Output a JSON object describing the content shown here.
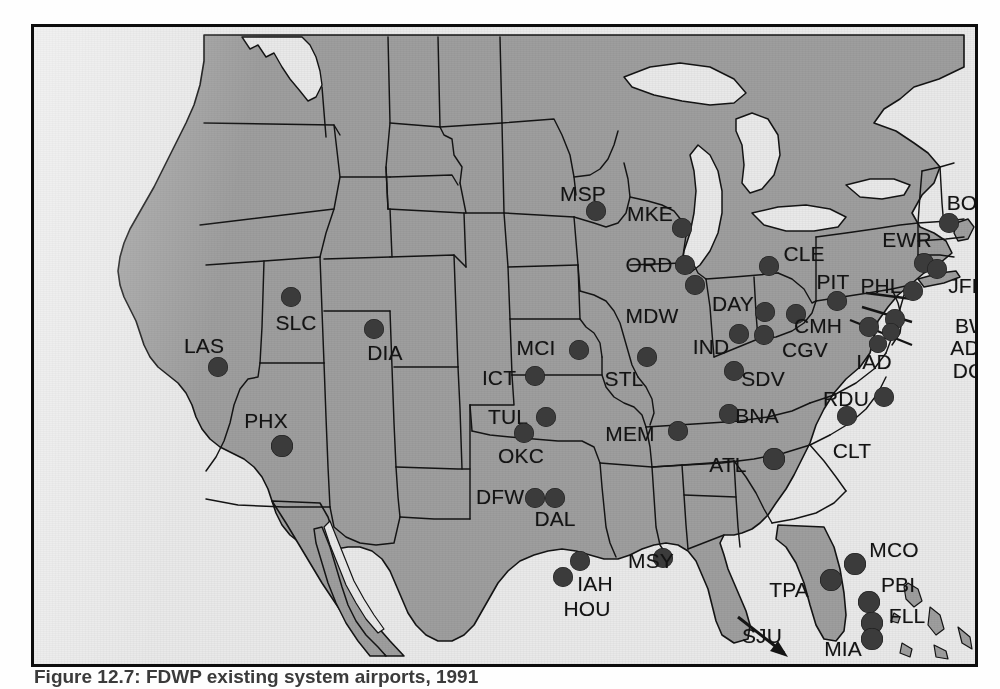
{
  "figure": {
    "caption_label": "Figure 12.7:",
    "caption_text": "FDWP existing system airports, 1991"
  },
  "map": {
    "title": "United States airport location map",
    "colors": {
      "land": "#9e9e9e",
      "water": "#e9e9e9",
      "border": "#141414",
      "marker": "#3b3b3b",
      "frame": "#0d0d0d"
    },
    "annotation": {
      "sju_arrow": "arrow pointing off-map to the southeast"
    },
    "airports": [
      {
        "code": "MSP",
        "label_x": 549,
        "label_y": 166,
        "dot_x": 562,
        "dot_y": 184,
        "r": 10
      },
      {
        "code": "MKE",
        "label_x": 616,
        "label_y": 186,
        "dot_x": 648,
        "dot_y": 201,
        "r": 10
      },
      {
        "code": "ORD",
        "label_x": 615,
        "label_y": 237,
        "dot_x": 651,
        "dot_y": 238,
        "r": 10
      },
      {
        "code": "MDW",
        "label_x": 618,
        "label_y": 288,
        "dot_x": 661,
        "dot_y": 258,
        "r": 10
      },
      {
        "code": "DAY",
        "label_x": 699,
        "label_y": 276,
        "dot_x": 731,
        "dot_y": 285,
        "r": 10
      },
      {
        "code": "IND",
        "label_x": 677,
        "label_y": 319,
        "dot_x": 705,
        "dot_y": 307,
        "r": 10
      },
      {
        "code": "CLE",
        "label_x": 770,
        "label_y": 226,
        "dot_x": 735,
        "dot_y": 239,
        "r": 10
      },
      {
        "code": "PIT",
        "label_x": 799,
        "label_y": 254,
        "dot_x": 803,
        "dot_y": 274,
        "r": 10
      },
      {
        "code": "PHL",
        "label_x": 847,
        "label_y": 258,
        "dot_x": 879,
        "dot_y": 264,
        "r": 10
      },
      {
        "code": "EWR",
        "label_x": 873,
        "label_y": 212,
        "dot_x": 890,
        "dot_y": 236,
        "r": 10
      },
      {
        "code": "JFK",
        "label_x": 933,
        "label_y": 258,
        "dot_x": 903,
        "dot_y": 242,
        "r": 10
      },
      {
        "code": "BOS",
        "label_x": 935,
        "label_y": 175,
        "dot_x": 915,
        "dot_y": 196,
        "r": 10
      },
      {
        "code": "CMH",
        "label_x": 784,
        "label_y": 298,
        "dot_x": 762,
        "dot_y": 287,
        "r": 10
      },
      {
        "code": "CGV",
        "label_x": 771,
        "label_y": 322,
        "dot_x": 730,
        "dot_y": 308,
        "r": 10
      },
      {
        "code": "IAD",
        "label_x": 840,
        "label_y": 334,
        "dot_x": 835,
        "dot_y": 300,
        "r": 10
      },
      {
        "code": "BWI",
        "label_x": 941,
        "label_y": 298,
        "dot_x": 861,
        "dot_y": 292,
        "r": 10
      },
      {
        "code": "ADW",
        "label_x": 941,
        "label_y": 320,
        "dot_x": 857,
        "dot_y": 305,
        "r": 9
      },
      {
        "code": "DCA",
        "label_x": 941,
        "label_y": 343,
        "dot_x": 844,
        "dot_y": 317,
        "r": 9
      },
      {
        "code": "SLC",
        "label_x": 262,
        "label_y": 295,
        "dot_x": 257,
        "dot_y": 270,
        "r": 10
      },
      {
        "code": "LAS",
        "label_x": 170,
        "label_y": 318,
        "dot_x": 184,
        "dot_y": 340,
        "r": 10
      },
      {
        "code": "DIA",
        "label_x": 351,
        "label_y": 325,
        "dot_x": 340,
        "dot_y": 302,
        "r": 10
      },
      {
        "code": "PHX",
        "label_x": 232,
        "label_y": 393,
        "dot_x": 248,
        "dot_y": 419,
        "r": 11
      },
      {
        "code": "MCI",
        "label_x": 502,
        "label_y": 320,
        "dot_x": 545,
        "dot_y": 323,
        "r": 10
      },
      {
        "code": "ICT",
        "label_x": 465,
        "label_y": 350,
        "dot_x": 501,
        "dot_y": 349,
        "r": 10
      },
      {
        "code": "STL",
        "label_x": 590,
        "label_y": 351,
        "dot_x": 613,
        "dot_y": 330,
        "r": 10
      },
      {
        "code": "TUL",
        "label_x": 474,
        "label_y": 389,
        "dot_x": 512,
        "dot_y": 390,
        "r": 10
      },
      {
        "code": "OKC",
        "label_x": 487,
        "label_y": 428,
        "dot_x": 490,
        "dot_y": 406,
        "r": 10
      },
      {
        "code": "MEM",
        "label_x": 596,
        "label_y": 406,
        "dot_x": 644,
        "dot_y": 404,
        "r": 10
      },
      {
        "code": "SDV",
        "label_x": 729,
        "label_y": 351,
        "dot_x": 700,
        "dot_y": 344,
        "r": 10
      },
      {
        "code": "BNA",
        "label_x": 723,
        "label_y": 388,
        "dot_x": 695,
        "dot_y": 387,
        "r": 10
      },
      {
        "code": "RDU",
        "label_x": 812,
        "label_y": 371,
        "dot_x": 813,
        "dot_y": 389,
        "r": 10
      },
      {
        "code": "CLT",
        "label_x": 818,
        "label_y": 423,
        "dot_x": 850,
        "dot_y": 370,
        "r": 10
      },
      {
        "code": "ATL",
        "label_x": 694,
        "label_y": 437,
        "dot_x": 740,
        "dot_y": 432,
        "r": 11
      },
      {
        "code": "DFW",
        "label_x": 466,
        "label_y": 469,
        "dot_x": 501,
        "dot_y": 471,
        "r": 10
      },
      {
        "code": "DAL",
        "label_x": 521,
        "label_y": 491,
        "dot_x": 521,
        "dot_y": 471,
        "r": 10
      },
      {
        "code": "IAH",
        "label_x": 561,
        "label_y": 556,
        "dot_x": 546,
        "dot_y": 534,
        "r": 10
      },
      {
        "code": "HOU",
        "label_x": 553,
        "label_y": 581,
        "dot_x": 529,
        "dot_y": 550,
        "r": 10
      },
      {
        "code": "MSY",
        "label_x": 617,
        "label_y": 533,
        "dot_x": 629,
        "dot_y": 531,
        "r": 10
      },
      {
        "code": "TPA",
        "label_x": 755,
        "label_y": 562,
        "dot_x": 797,
        "dot_y": 553,
        "r": 11
      },
      {
        "code": "MCO",
        "label_x": 860,
        "label_y": 522,
        "dot_x": 821,
        "dot_y": 537,
        "r": 11
      },
      {
        "code": "PBI",
        "label_x": 864,
        "label_y": 557,
        "dot_x": 835,
        "dot_y": 575,
        "r": 11
      },
      {
        "code": "FLL",
        "label_x": 873,
        "label_y": 588,
        "dot_x": 838,
        "dot_y": 596,
        "r": 11
      },
      {
        "code": "MIA",
        "label_x": 809,
        "label_y": 621,
        "dot_x": 838,
        "dot_y": 612,
        "r": 11
      },
      {
        "code": "SJU",
        "label_x": 728,
        "label_y": 608,
        "dot_x": null,
        "dot_y": null,
        "r": 0
      }
    ]
  }
}
